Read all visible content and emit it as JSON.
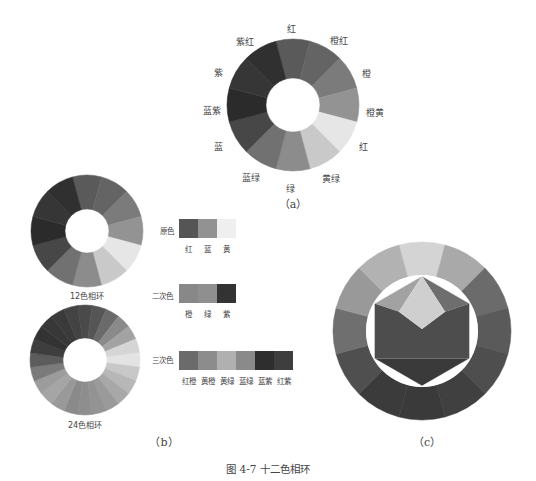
{
  "figure_caption": "图 4-7   十二色相环",
  "panel_a": {
    "caption": "（a）",
    "center": [
      293,
      105
    ],
    "outer_r": 66,
    "inner_r": 27,
    "start_deg": -15,
    "segments": [
      {
        "label": "红",
        "color": "#5a5a5a",
        "lx": 291,
        "ly": 28
      },
      {
        "label": "橙红",
        "color": "#646464",
        "lx": 339,
        "ly": 40
      },
      {
        "label": "橙",
        "color": "#7b7b7b",
        "lx": 366,
        "ly": 73
      },
      {
        "label": "橙黄",
        "color": "#939393",
        "lx": 375,
        "ly": 112
      },
      {
        "label": "红",
        "color": "#e6e6e6",
        "lx": 363,
        "ly": 146
      },
      {
        "label": "黄绿",
        "color": "#c9c9c9",
        "lx": 331,
        "ly": 178
      },
      {
        "label": "绿",
        "color": "#8c8c8c",
        "lx": 290,
        "ly": 188
      },
      {
        "label": "蓝绿",
        "color": "#717171",
        "lx": 251,
        "ly": 177
      },
      {
        "label": "蓝",
        "color": "#474747",
        "lx": 218,
        "ly": 146
      },
      {
        "label": "蓝紫",
        "color": "#2b2b2b",
        "lx": 212,
        "ly": 110
      },
      {
        "label": "紫",
        "color": "#363636",
        "lx": 218,
        "ly": 72
      },
      {
        "label": "紫红",
        "color": "#303030",
        "lx": 245,
        "ly": 41
      }
    ]
  },
  "panel_b": {
    "caption": "（b）",
    "wheel12": {
      "label": "12色相环",
      "center": [
        87,
        231
      ],
      "outer_r": 56,
      "inner_r": 22,
      "start_deg": -15,
      "colors": [
        "#5a5a5a",
        "#646464",
        "#7b7b7b",
        "#939393",
        "#e6e6e6",
        "#c9c9c9",
        "#8c8c8c",
        "#717171",
        "#474747",
        "#2b2b2b",
        "#363636",
        "#303030"
      ]
    },
    "wheel24": {
      "label": "24色相环",
      "center": [
        85,
        360
      ],
      "outer_r": 55,
      "inner_r": 22,
      "start_deg": -7.5,
      "colors": [
        "#4a4a4a",
        "#555555",
        "#6a6a6a",
        "#8a8a8a",
        "#a3a3a3",
        "#d5d5d5",
        "#e3e3e3",
        "#c8c8c8",
        "#b7b7b7",
        "#a8a8a8",
        "#9a9a9a",
        "#939393",
        "#8e8e8e",
        "#8a8a8a",
        "#999999",
        "#a5a5a5",
        "#9c9c9c",
        "#7b7b7b",
        "#5c5c5c",
        "#3e3e3e",
        "#333333",
        "#383838",
        "#3a3a3a",
        "#434343"
      ]
    },
    "primary": {
      "title": "原色",
      "swatches": [
        {
          "label": "红",
          "color": "#555555"
        },
        {
          "label": "蓝",
          "color": "#929292"
        },
        {
          "label": "黄",
          "color": "#efefef"
        }
      ]
    },
    "secondary": {
      "title": "二次色",
      "swatches": [
        {
          "label": "橙",
          "color": "#888888"
        },
        {
          "label": "绿",
          "color": "#8f8f8f"
        },
        {
          "label": "紫",
          "color": "#333333"
        }
      ]
    },
    "tertiary": {
      "title": "三次色",
      "swatches": [
        {
          "label": "红橙",
          "color": "#6b6b6b"
        },
        {
          "label": "黄橙",
          "color": "#8c8c8c"
        },
        {
          "label": "黄绿",
          "color": "#b0b0b0"
        },
        {
          "label": "蓝绿",
          "color": "#8a8a8a"
        },
        {
          "label": "蓝紫",
          "color": "#2e2e2e"
        },
        {
          "label": "红紫",
          "color": "#3e3e3e"
        }
      ]
    }
  },
  "panel_c": {
    "caption": "（c）",
    "center": [
      422,
      331
    ],
    "outer_r": 89,
    "inner_r": 56,
    "start_deg": -15,
    "ring_colors": [
      "#d4d4d4",
      "#a9a9a9",
      "#6b6b6b",
      "#5a5a5a",
      "#4e4e4e",
      "#404040",
      "#3a3a3a",
      "#3b3b3b",
      "#4f4f4f",
      "#6f6f6f",
      "#999999",
      "#b2b2b2"
    ],
    "hexagon": {
      "center_kite": "#cfcfcf",
      "upper_left": "#a2a2a2",
      "upper_right": "#6e6e6e",
      "middle": "#4d4d4d",
      "lower": "#3a3a3a",
      "gap": "#ffffff"
    }
  }
}
